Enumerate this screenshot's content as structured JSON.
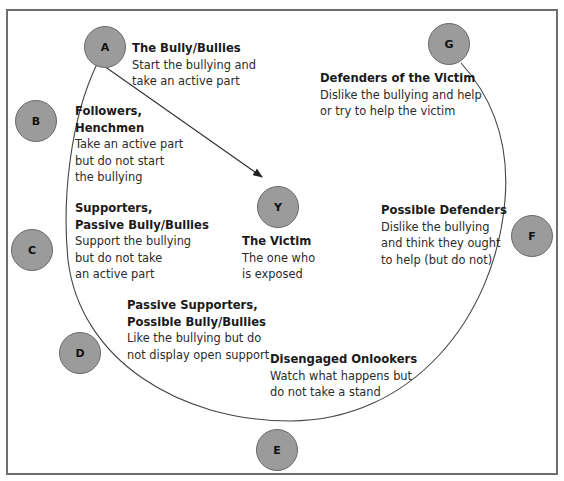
{
  "diagram": {
    "type": "bullying-circle",
    "nodes": [
      {
        "id": "A",
        "letter": "A",
        "title": "The Bully/Bullies",
        "desc": [
          "Start the bullying and",
          "take an active part"
        ]
      },
      {
        "id": "B",
        "letter": "B",
        "title": [
          "Followers,",
          "Henchmen"
        ],
        "desc": [
          "Take an active part",
          "but do not start",
          "the bullying"
        ]
      },
      {
        "id": "C",
        "letter": "C",
        "title": [
          "Supporters,",
          "Passive Bully/Bullies"
        ],
        "desc": [
          "Support the bullying",
          "but do not take",
          "an active part"
        ]
      },
      {
        "id": "D",
        "letter": "D",
        "title": [
          "Passive Supporters,",
          "Possible Bully/Bullies"
        ],
        "desc": [
          "Like the bullying but do",
          "not display open support"
        ]
      },
      {
        "id": "E",
        "letter": "E",
        "title": "Disengaged Onlookers",
        "desc": [
          "Watch what happens but",
          "do not take a stand"
        ]
      },
      {
        "id": "F",
        "letter": "F",
        "title": "Possible Defenders",
        "desc": [
          "Dislike the bullying",
          "and think they ought",
          "to help (but do not)"
        ]
      },
      {
        "id": "G",
        "letter": "G",
        "title": "Defenders of the Victim",
        "desc": [
          "Dislike the bullying and help",
          "or try to help the victim"
        ]
      },
      {
        "id": "Y",
        "letter": "Y",
        "title": "The Victim",
        "desc": [
          "The one who",
          "is exposed"
        ]
      }
    ],
    "edges": [
      {
        "from": "A",
        "to": "Y",
        "style": "arrow"
      }
    ],
    "colors": {
      "node_fill": "#9b9b9b",
      "node_stroke": "#6a6a6a",
      "line": "#444444",
      "frame": "#6e6e6e"
    }
  }
}
